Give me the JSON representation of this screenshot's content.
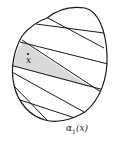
{
  "figure": {
    "point_label": "x",
    "curve_label_main": "α",
    "curve_label_sub": "1",
    "curve_label_arg": "(x)",
    "colors": {
      "stroke": "#1a1a1a",
      "shade": "#d9d9d9",
      "background": "#ffffff"
    }
  }
}
